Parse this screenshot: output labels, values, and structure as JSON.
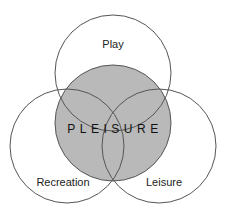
{
  "diagram": {
    "type": "venn",
    "sets": [
      {
        "id": "play",
        "label": "Play"
      },
      {
        "id": "recreation",
        "label": "Recreation"
      },
      {
        "id": "leisure",
        "label": "Leisure"
      }
    ],
    "center": {
      "label": "PLEISURE"
    },
    "colors": {
      "stroke": "#555555",
      "shade": "#b9b9b9",
      "background": "#ffffff"
    }
  }
}
